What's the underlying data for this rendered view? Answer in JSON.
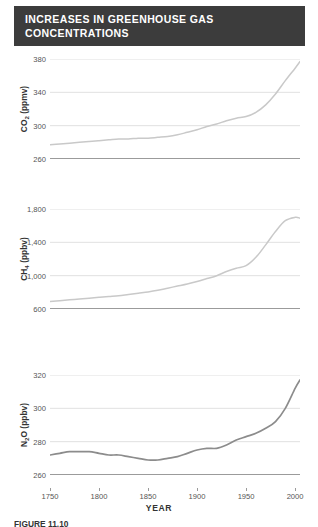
{
  "title": {
    "line1": "INCREASES IN GREENHOUSE GAS",
    "line2": "CONCENTRATIONS"
  },
  "caption": {
    "text": "FIGURE 11.10"
  },
  "axis": {
    "x_title": "YEAR",
    "x_ticks": [
      "1750",
      "1800",
      "1850",
      "1900",
      "1950",
      "2000"
    ]
  },
  "colors": {
    "banner": "#3c3c3c",
    "banner_text": "#ffffff",
    "light_line": "#c9c9c9",
    "dark_line": "#8c8c8c",
    "gridline": "#d8d8d8",
    "axis": "#7a7a7a",
    "tick_text": "#555555"
  },
  "panels": [
    {
      "id": "co2",
      "y_label_main": "CO",
      "y_label_sub": "2",
      "y_label_unit": " (ppmv)",
      "y_ticks": [
        "380",
        "340",
        "300",
        "260"
      ]
    },
    {
      "id": "ch4",
      "y_label_main": "CH",
      "y_label_sub": "4",
      "y_label_unit": " (ppbv)",
      "y_ticks": [
        "1,800",
        "1,400",
        "1,000",
        "600"
      ]
    },
    {
      "id": "n2o",
      "y_label_main": "N",
      "y_label_sub": "2",
      "y_label_unit": "O (ppbv)",
      "y_ticks": [
        "320",
        "300",
        "280",
        "260"
      ]
    }
  ],
  "chart_data": {
    "type": "line",
    "title": "INCREASES IN GREENHOUSE GAS CONCENTRATIONS",
    "xlabel": "YEAR",
    "xlim": [
      1750,
      2005
    ],
    "grid": true,
    "legend": "none",
    "panels": [
      {
        "name": "CO2",
        "ylabel": "CO2 (ppmv)",
        "ylim": [
          260,
          380
        ],
        "yticks": [
          260,
          300,
          340,
          380
        ],
        "line_color": "#c9c9c9",
        "x": [
          1750,
          1760,
          1770,
          1780,
          1790,
          1800,
          1810,
          1820,
          1830,
          1840,
          1850,
          1860,
          1870,
          1880,
          1890,
          1900,
          1910,
          1920,
          1930,
          1940,
          1950,
          1960,
          1970,
          1980,
          1990,
          2000,
          2005
        ],
        "y": [
          277,
          278,
          279,
          280,
          281,
          282,
          283,
          284,
          284,
          285,
          285,
          286,
          287,
          289,
          292,
          295,
          299,
          302,
          306,
          309,
          311,
          316,
          325,
          338,
          354,
          369,
          377
        ]
      },
      {
        "name": "CH4",
        "ylabel": "CH4 (ppbv)",
        "ylim": [
          600,
          1800
        ],
        "yticks": [
          600,
          1000,
          1400,
          1800
        ],
        "line_color": "#c9c9c9",
        "x": [
          1750,
          1760,
          1770,
          1780,
          1790,
          1800,
          1810,
          1820,
          1830,
          1840,
          1850,
          1860,
          1870,
          1880,
          1890,
          1900,
          1910,
          1920,
          1930,
          1940,
          1950,
          1960,
          1970,
          1980,
          1990,
          2000,
          2005
        ],
        "y": [
          690,
          700,
          710,
          720,
          730,
          740,
          750,
          760,
          775,
          790,
          805,
          825,
          850,
          875,
          900,
          930,
          965,
          1000,
          1050,
          1090,
          1120,
          1220,
          1370,
          1530,
          1660,
          1700,
          1690
        ]
      },
      {
        "name": "N2O",
        "ylabel": "N2O (ppbv)",
        "ylim": [
          260,
          320
        ],
        "yticks": [
          260,
          280,
          300,
          320
        ],
        "line_color": "#8c8c8c",
        "x": [
          1750,
          1760,
          1770,
          1780,
          1790,
          1800,
          1810,
          1820,
          1830,
          1840,
          1850,
          1860,
          1870,
          1880,
          1890,
          1900,
          1910,
          1920,
          1930,
          1940,
          1950,
          1960,
          1970,
          1980,
          1990,
          2000,
          2005
        ],
        "y": [
          272,
          273,
          274,
          274,
          274,
          273,
          272,
          272,
          271,
          270,
          269,
          269,
          270,
          271,
          273,
          275,
          276,
          276,
          278,
          281,
          283,
          285,
          288,
          292,
          300,
          312,
          317
        ]
      }
    ]
  }
}
